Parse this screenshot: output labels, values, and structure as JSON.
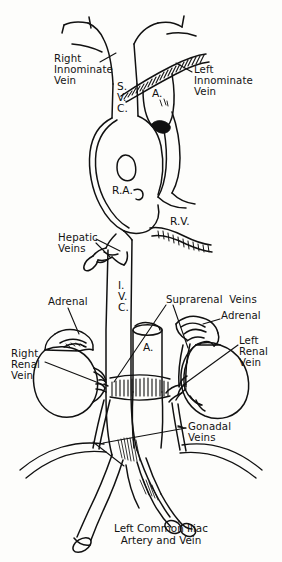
{
  "figure": {
    "background_color": "#fdfdfb",
    "ink_color": "#111111"
  },
  "labels": {
    "right_innominate_vein": "Right\nInnominate\nVein",
    "left_innominate_vein": "Left\nInnominate\nVein",
    "svc": "S.\nV.\nC.",
    "aorta_arch": "A.",
    "right_atrium": "R.A.",
    "right_ventricle": "R.V.",
    "hepatic_veins": "Hepatic\nVeins",
    "ivc": "I.\nV.\nC.",
    "suprarenal_veins": "Suprarenal  Veins",
    "adrenal_left_side": "Adrenal",
    "adrenal_right_side": "Adrenal",
    "right_renal_vein": "Right\nRenal\nVein",
    "left_renal_vein": "Left\nRenal\nVein",
    "gonadal_veins": "Gonadal\nVeins",
    "aorta_abdominal": "A.",
    "caption": "Left Common Iliac\nArtery and Vein"
  },
  "structures": [
    "superior vena cava",
    "right innominate vein",
    "left innominate vein",
    "aortic arch",
    "right atrium",
    "right ventricle",
    "hepatic veins",
    "inferior vena cava",
    "suprarenal veins",
    "right adrenal gland",
    "left adrenal gland",
    "right kidney",
    "left kidney",
    "right renal vein",
    "left renal vein",
    "gonadal veins",
    "abdominal aorta",
    "left common iliac artery",
    "left common iliac vein",
    "diaphragm"
  ]
}
